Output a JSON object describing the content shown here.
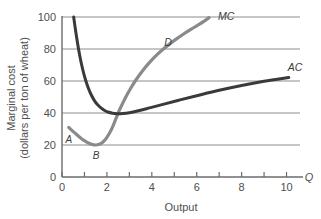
{
  "chart_data": {
    "type": "line",
    "title": "",
    "xlabel": "Output",
    "ylabel_line1": "Marginal cost",
    "ylabel_line2": "(dollars per ton of wheat)",
    "x_axis_variable": "Q",
    "xlim": [
      0,
      10.6
    ],
    "ylim": [
      0,
      100
    ],
    "xticks": [
      0,
      1,
      2,
      3,
      4,
      5,
      6,
      7,
      8,
      9,
      10
    ],
    "xtick_labels": [
      "0",
      "",
      "2",
      "",
      "4",
      "",
      "6",
      "",
      "8",
      "",
      "10"
    ],
    "yticks": [
      0,
      20,
      40,
      60,
      80,
      100
    ],
    "ytick_labels": [
      "0",
      "20",
      "40",
      "60",
      "80",
      "100"
    ],
    "grid": "horizontal",
    "grid_color": "#8c8c8c",
    "series": [
      {
        "name": "MC",
        "label": "MC",
        "color": "#8a8a8a",
        "width": 3.2,
        "points": [
          [
            0.3,
            31.0
          ],
          [
            0.45,
            29.0
          ],
          [
            0.6,
            27.2
          ],
          [
            0.75,
            25.3
          ],
          [
            0.9,
            23.6
          ],
          [
            1.05,
            22.2
          ],
          [
            1.2,
            21.1
          ],
          [
            1.35,
            20.3
          ],
          [
            1.5,
            20.0
          ],
          [
            1.65,
            20.4
          ],
          [
            1.8,
            21.6
          ],
          [
            1.95,
            23.8
          ],
          [
            2.1,
            27.0
          ],
          [
            2.25,
            31.2
          ],
          [
            2.4,
            36.4
          ],
          [
            2.55,
            41.6
          ],
          [
            2.7,
            46.0
          ],
          [
            2.9,
            51.5
          ],
          [
            3.1,
            56.4
          ],
          [
            3.3,
            60.8
          ],
          [
            3.6,
            66.6
          ],
          [
            3.9,
            71.6
          ],
          [
            4.2,
            76.0
          ],
          [
            4.5,
            79.8
          ],
          [
            4.8,
            83.2
          ],
          [
            5.1,
            86.3
          ],
          [
            5.4,
            89.2
          ],
          [
            5.7,
            91.9
          ],
          [
            6.0,
            94.5
          ],
          [
            6.3,
            97.1
          ],
          [
            6.55,
            99.6
          ]
        ]
      },
      {
        "name": "AC",
        "label": "AC",
        "color": "#3a3a3a",
        "width": 3.0,
        "points": [
          [
            0.52,
            100.0
          ],
          [
            0.6,
            92.0
          ],
          [
            0.7,
            83.0
          ],
          [
            0.8,
            75.2
          ],
          [
            0.9,
            68.6
          ],
          [
            1.0,
            63.0
          ],
          [
            1.1,
            58.4
          ],
          [
            1.2,
            54.6
          ],
          [
            1.3,
            51.4
          ],
          [
            1.45,
            47.6
          ],
          [
            1.6,
            45.0
          ],
          [
            1.75,
            43.0
          ],
          [
            1.9,
            41.6
          ],
          [
            2.05,
            40.6
          ],
          [
            2.25,
            39.9
          ],
          [
            2.45,
            39.6
          ],
          [
            2.7,
            39.7
          ],
          [
            3.0,
            40.2
          ],
          [
            3.4,
            41.4
          ],
          [
            3.9,
            43.2
          ],
          [
            4.5,
            45.4
          ],
          [
            5.2,
            48.0
          ],
          [
            6.0,
            50.8
          ],
          [
            7.0,
            54.2
          ],
          [
            8.0,
            57.2
          ],
          [
            9.0,
            59.8
          ],
          [
            10.1,
            62.2
          ]
        ]
      }
    ],
    "curve_labels": [
      {
        "text": "MC",
        "x": 6.95,
        "y": 100.5,
        "name": "mc-curve-label"
      },
      {
        "text": "AC",
        "x": 10.05,
        "y": 68.5,
        "name": "ac-curve-label"
      },
      {
        "text": "D",
        "x": 4.55,
        "y": 84.5,
        "name": "point-d-label"
      }
    ],
    "point_labels": [
      {
        "text": "A",
        "x": 0.3,
        "y": 24.0,
        "name": "point-a-label"
      },
      {
        "text": "B",
        "x": 1.52,
        "y": 13.5,
        "name": "point-b-label"
      }
    ],
    "annotations": [
      {
        "name": "point-d",
        "desc": "D on MC curve near 80"
      }
    ]
  }
}
